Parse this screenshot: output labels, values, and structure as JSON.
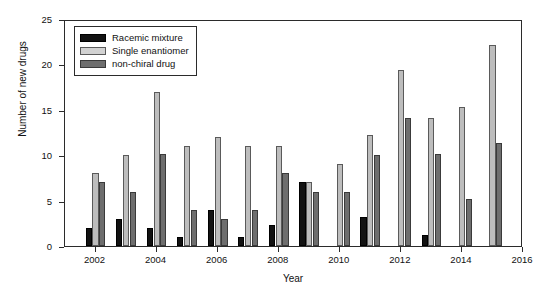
{
  "chart_data": {
    "type": "bar",
    "title": "",
    "subtitle": "",
    "xlabel": "Year",
    "ylabel": "Number of new drugs",
    "xlim": [
      2001,
      2016
    ],
    "ylim": [
      0,
      25
    ],
    "ytick_labels": [
      "0",
      "5",
      "10",
      "15",
      "20",
      "25"
    ],
    "yticks": [
      0,
      5,
      10,
      15,
      20,
      25
    ],
    "xtick_labels": [
      "2002",
      "2004",
      "2006",
      "2008",
      "2010",
      "2012",
      "2014",
      "2016"
    ],
    "xticks": [
      2002,
      2004,
      2006,
      2008,
      2010,
      2012,
      2014,
      2016
    ],
    "grid": false,
    "legend_position": "upper-left-inside",
    "categories": [
      2002,
      2003,
      2004,
      2005,
      2006,
      2007,
      2008,
      2009,
      2010,
      2011,
      2012,
      2013,
      2014,
      2015
    ],
    "series": [
      {
        "name": "Racemic mixture",
        "color": "#121212",
        "values": [
          2,
          3,
          2,
          1,
          4,
          1,
          2.3,
          7,
          0,
          3.2,
          0,
          1.2,
          0,
          0
        ]
      },
      {
        "name": "Single enantiomer",
        "color": "#bdbdbd",
        "values": [
          8,
          10,
          17,
          11,
          12,
          11,
          11,
          7,
          9,
          12.2,
          19.4,
          14.1,
          15.3,
          22.1
        ]
      },
      {
        "name": "non-chiral drug",
        "color": "#6e6e6e",
        "values": [
          7,
          6,
          10.1,
          4,
          3,
          4,
          8,
          6,
          6,
          10,
          14.1,
          10.1,
          5.2,
          11.3
        ]
      }
    ]
  },
  "legend": {
    "items": [
      {
        "label": "Racemic mixture",
        "swatch": "racemic"
      },
      {
        "label": "Single enantiomer",
        "swatch": "single"
      },
      {
        "label": "non-chiral drug",
        "swatch": "nonchiral"
      }
    ]
  }
}
